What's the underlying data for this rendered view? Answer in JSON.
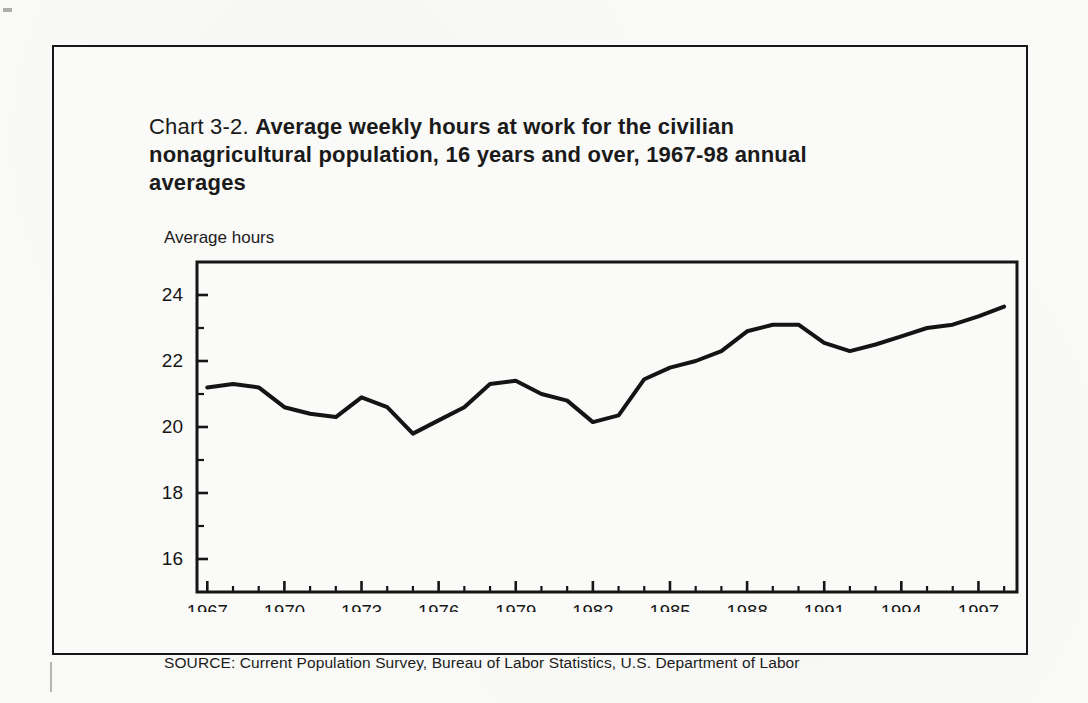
{
  "page": {
    "background": "#f9f9f7",
    "ink_color": "#161616"
  },
  "figure": {
    "title": {
      "prefix": "Chart 3-2.",
      "bold_rest_line1": "Average weekly hours at work for the civilian",
      "bold_line2": "nonagricultural population, 16 years and over, 1967-98",
      "bold_line3": "annual averages"
    },
    "y_axis_title": "Average hours",
    "source": "SOURCE: Current Population Survey, Bureau of Labor Statistics, U.S. Department of Labor"
  },
  "chart_data": {
    "type": "line",
    "title": "Chart 3-2. Average weekly hours at work for the civilian nonagricultural population, 16 years and over, 1967-98 annual averages",
    "xlabel": "",
    "ylabel": "Average hours",
    "x": [
      1967,
      1968,
      1969,
      1970,
      1971,
      1972,
      1973,
      1974,
      1975,
      1976,
      1977,
      1978,
      1979,
      1980,
      1981,
      1982,
      1983,
      1984,
      1985,
      1986,
      1987,
      1988,
      1989,
      1990,
      1991,
      1992,
      1993,
      1994,
      1995,
      1996,
      1997,
      1998
    ],
    "values": [
      21.2,
      21.3,
      21.2,
      20.6,
      20.4,
      20.3,
      20.9,
      20.6,
      19.8,
      20.2,
      20.6,
      21.3,
      21.4,
      21.0,
      20.8,
      20.15,
      20.35,
      21.45,
      21.8,
      22.0,
      22.3,
      22.9,
      23.1,
      23.1,
      22.55,
      22.3,
      22.5,
      22.75,
      23.0,
      23.1,
      23.35,
      23.65
    ],
    "ylim": [
      15,
      25
    ],
    "xlim": [
      1966.6,
      1998.5
    ],
    "y_ticks_major": [
      16,
      18,
      20,
      22,
      24
    ],
    "y_ticks_minor": [
      17,
      19,
      21,
      23
    ],
    "x_ticks_major": [
      1967,
      1970,
      1973,
      1976,
      1979,
      1982,
      1985,
      1988,
      1991,
      1994,
      1997
    ],
    "x_minor_tick_every_year": true,
    "grid": false,
    "legend": "none",
    "line_color": "#141414",
    "frame": "full-box"
  }
}
